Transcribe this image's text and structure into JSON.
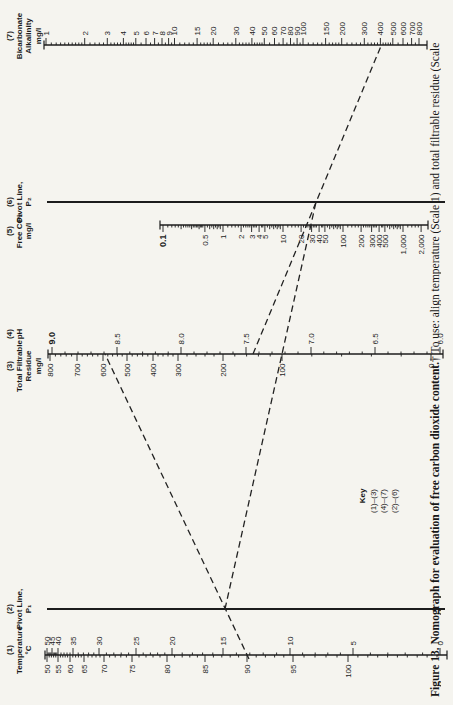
{
  "figure": {
    "caption_bold": "Figure 13. Nomograph for evaluation of free carbon dioxide content.",
    "caption_rest": "† To use: align temperature (Scale 1) and total filtrable residue (Scale",
    "paper_color": "#f5f4ef",
    "ink_color": "#1c1c1c"
  },
  "key": {
    "title": "Key",
    "lines": [
      "(1)–(3)",
      "(4)–(7)",
      "(2)–(6)"
    ]
  },
  "chart_data": {
    "type": "nomograph",
    "orientation": "landscape page rotated 90° counterclockwise",
    "scales": [
      {
        "id": "temperature",
        "num": "(1)",
        "x": 50,
        "y1": 45,
        "y2": 447,
        "caps": true,
        "line_w": 1.3,
        "titles": [
          {
            "dx": 5,
            "lines": [
              "(1)",
              "Temperature",
              "°C"
            ]
          }
        ],
        "sides": [
          {
            "side": "right",
            "minor_between": 4,
            "labeled": [
              [
                "50",
                47
              ],
              [
                "45",
                52
              ],
              [
                "40",
                58
              ],
              [
                "35",
                73
              ],
              [
                "30",
                99
              ],
              [
                "25",
                136
              ],
              [
                "20",
                172
              ],
              [
                "15",
                223
              ],
              [
                "10",
                290
              ],
              [
                "5",
                353
              ],
              [
                "0",
                440
              ]
            ]
          },
          {
            "side": "left",
            "minor_between": 4,
            "extend": {
              "to": 437,
              "n": 9
            },
            "labeled": [
              [
                "50",
                47
              ],
              [
                "55",
                58
              ],
              [
                "60",
                70
              ],
              [
                "65",
                84
              ],
              [
                "70",
                104
              ],
              [
                "75",
                132
              ],
              [
                "80",
                167
              ],
              [
                "85",
                205
              ],
              [
                "90",
                247
              ],
              [
                "95",
                293
              ],
              [
                "100",
                348
              ]
            ]
          }
        ]
      },
      {
        "id": "pivot-line-p1",
        "num": "(2)",
        "x": 96,
        "y1": 47,
        "y2": 445,
        "caps": false,
        "line_w": 2,
        "titles": [
          {
            "dx": 0,
            "lines": [
              "(2)",
              "Pivot Line,",
              "P₁"
            ]
          }
        ],
        "sides": []
      },
      {
        "id": "residue-ph",
        "num": "(3)(4)",
        "x": 351,
        "y1": 48,
        "y2": 443,
        "caps": true,
        "line_w": 1.3,
        "titles": [
          {
            "dx": -12,
            "lines": [
              "(3)",
              "Total Filtrable",
              "Residue",
              "mg/l"
            ]
          },
          {
            "dx": 20,
            "lines": [
              "(4)",
              "pH"
            ]
          }
        ],
        "sides": [
          {
            "side": "left",
            "minor_between": 4,
            "labeled": [
              [
                "800",
                50
              ],
              [
                "700",
                77
              ],
              [
                "600",
                103
              ],
              [
                "500",
                127
              ],
              [
                "400",
                153
              ],
              [
                "300",
                178
              ],
              [
                "200",
                223
              ],
              [
                "100",
                282
              ],
              [
                "0",
                431
              ]
            ]
          },
          {
            "side": "right",
            "minor_between": 4,
            "bold": [
              "9.0"
            ],
            "labeled": [
              [
                "9.0",
                52
              ],
              [
                "8.5",
                117
              ],
              [
                "8.0",
                181
              ],
              [
                "7.5",
                246
              ],
              [
                "7.0",
                311
              ],
              [
                "6.5",
                375
              ],
              [
                "6.0",
                440
              ]
            ]
          }
        ]
      },
      {
        "id": "free-co2",
        "num": "(5)",
        "x": 480,
        "y1": 160,
        "y2": 428,
        "caps": true,
        "line_w": 1.3,
        "titles": [
          {
            "dx": -6,
            "lines": [
              "(5)",
              "Free CO₂",
              "mg/l"
            ]
          }
        ],
        "sides": [
          {
            "side": "left",
            "bold": [
              "0.1"
            ],
            "log": {
              "anchor_v": 0.1,
              "anchor_p": 163,
              "px_per_decade": 60,
              "min": 0.1,
              "max": 2000,
              "dense": false
            },
            "labels": [
              "0.1",
              "0.5",
              "1",
              "2",
              "3",
              "4",
              "5",
              "10",
              "20",
              "30",
              "40",
              "50",
              "100",
              "200",
              "300",
              "400",
              "500",
              "1,000",
              "2,000"
            ]
          }
        ]
      },
      {
        "id": "pivot-line-p2",
        "num": "(6)",
        "x": 503,
        "y1": 47,
        "y2": 445,
        "caps": false,
        "line_w": 2,
        "titles": [
          {
            "dx": 0,
            "lines": [
              "(6)",
              "Pivot Line,",
              "P₂"
            ]
          }
        ],
        "sides": []
      },
      {
        "id": "bicarbonate-alkalinity",
        "num": "(7)",
        "x": 660,
        "y1": 44,
        "y2": 427,
        "caps": true,
        "line_w": 1.3,
        "titles": [
          {
            "dx": 9,
            "lines": [
              "(7)",
              "Bicarbonate",
              "Alkalinity",
              "mg/l"
            ]
          }
        ],
        "sides": [
          {
            "side": "right",
            "log": {
              "anchor_v": 1,
              "anchor_p": 46,
              "px_per_decade": 128.5,
              "min": 1,
              "max": 800,
              "dense": true
            },
            "labels": [
              "1",
              "2",
              "3",
              "4",
              "5",
              "6",
              "7",
              "8",
              "9",
              "10",
              "15",
              "20",
              "30",
              "40",
              "50",
              "60",
              "70",
              "80",
              "90",
              "100",
              "150",
              "200",
              "300",
              "400",
              "500",
              "600",
              "700",
              "800"
            ]
          }
        ]
      }
    ],
    "example_lines": [
      {
        "name": "align-scale1-to-scale3",
        "from": [
          46,
          249
        ],
        "to": [
          351,
          105
        ]
      },
      {
        "name": "align-pivot1-to-pivot2",
        "from": [
          96,
          225
        ],
        "to": [
          503,
          316
        ]
      },
      {
        "name": "align-scale4-to-scale7",
        "from": [
          351,
          253
        ],
        "to": [
          659,
          381
        ]
      }
    ],
    "dash": {
      "pattern": "6.5 4",
      "width": 1.3
    }
  }
}
